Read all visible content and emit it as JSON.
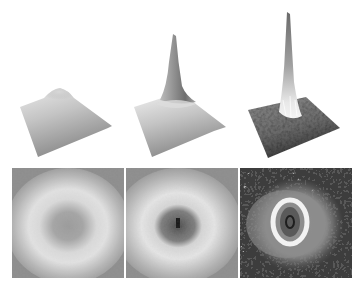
{
  "figure": {
    "colors": {
      "background": "#ffffff",
      "surface_light": "#e6e6e6",
      "surface_mid": "#9a9a9a",
      "surface_dark": "#3a3a3a",
      "map_background": "#8c8c8c",
      "ring": "#eeeeee",
      "core_dark": "#1e1e1e"
    },
    "surfaces": [
      {
        "index": 1,
        "peak": "low broad hump",
        "background": "smooth"
      },
      {
        "index": 2,
        "peak": "medium sharp spike",
        "background": "smooth"
      },
      {
        "index": 3,
        "peak": "tall sharp spike",
        "background": "noisy dark"
      }
    ],
    "maps": [
      {
        "index": 1,
        "feature": "diffuse bright ring, gray center",
        "noise": "low"
      },
      {
        "index": 2,
        "feature": "bright ring, darker core with black spot",
        "noise": "low"
      },
      {
        "index": 3,
        "feature": "thin sharp bright ring, dark core, noisy speckled background",
        "noise": "high"
      }
    ]
  }
}
